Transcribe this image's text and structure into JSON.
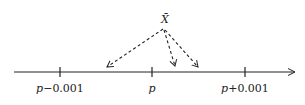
{
  "diagram": {
    "top_label": "X̄",
    "ticks": [
      {
        "label_var": "p",
        "label_op": "−",
        "label_num": "0.001",
        "x": 60
      },
      {
        "label_var": "p",
        "label_op": "",
        "label_num": "",
        "x": 152
      },
      {
        "label_var": "p",
        "label_op": "+",
        "label_num": "0.001",
        "x": 245
      }
    ],
    "arrows": [
      {
        "from": [
          163,
          29
        ],
        "to": [
          107,
          67
        ],
        "style": "dashed"
      },
      {
        "from": [
          163,
          29
        ],
        "to": [
          175,
          66
        ],
        "style": "dashed"
      },
      {
        "from": [
          163,
          29
        ],
        "to": [
          198,
          67
        ],
        "style": "dashed"
      }
    ],
    "axis": {
      "y": 72,
      "x_start": 14,
      "x_end": 296
    },
    "colors": {
      "stroke": "#222222",
      "background": "#ffffff"
    }
  }
}
